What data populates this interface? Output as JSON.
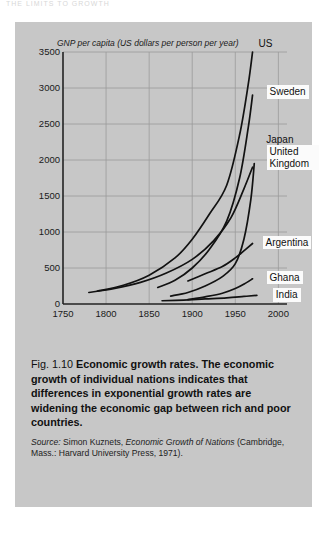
{
  "page": {
    "cut_off_header": "THE LIMITS TO GROWTH"
  },
  "figure": {
    "caption_number": "Fig. 1.10",
    "caption_lead": "Economic growth rates.",
    "caption_text": "The economic growth of individual nations indicates that differences in exponential growth rates are widening the economic gap between rich and poor countries.",
    "source_label": "Source:",
    "source_author": "Simon Kuznets,",
    "source_title": "Economic Growth of Nations",
    "source_publication": "(Cambridge, Mass.: Harvard University Press, 1971)."
  },
  "colors": {
    "panel_background": "#c7c7c7",
    "page_background": "#ffffff",
    "curve": "#121212",
    "grid": "#9a9a9a",
    "axis": "#222222",
    "label_box": "#fbfbfb"
  },
  "chart_data": {
    "type": "line",
    "title": "",
    "axis_title": "GNP per capita (US dollars per person per year)",
    "xlabel": "",
    "ylabel": "GNP per capita (US dollars per person per year)",
    "xlim": [
      1750,
      2010
    ],
    "ylim": [
      0,
      3500
    ],
    "xticks": [
      1750,
      1800,
      1850,
      1900,
      1950,
      2000
    ],
    "yticks": [
      0,
      500,
      1000,
      1500,
      2000,
      2500,
      3000,
      3500
    ],
    "grid": true,
    "legend_position": "inline-labels",
    "series": [
      {
        "name": "US",
        "label_boxed": false,
        "x": [
          1790,
          1820,
          1850,
          1880,
          1900,
          1920,
          1940,
          1955,
          1965,
          1970
        ],
        "y": [
          180,
          260,
          400,
          640,
          900,
          1250,
          1650,
          2350,
          3050,
          3500
        ]
      },
      {
        "name": "Sweden",
        "label_boxed": true,
        "x": [
          1860,
          1880,
          1900,
          1920,
          1940,
          1955,
          1965,
          1970
        ],
        "y": [
          230,
          330,
          500,
          760,
          1150,
          1750,
          2450,
          2900
        ]
      },
      {
        "name": "United Kingdom",
        "label_boxed": true,
        "x": [
          1780,
          1810,
          1840,
          1870,
          1900,
          1925,
          1945,
          1960,
          1970
        ],
        "y": [
          160,
          215,
          300,
          430,
          620,
          880,
          1200,
          1600,
          1900
        ]
      },
      {
        "name": "Japan",
        "label_boxed": false,
        "x": [
          1875,
          1895,
          1915,
          1935,
          1950,
          1960,
          1968,
          1972
        ],
        "y": [
          110,
          160,
          250,
          380,
          560,
          900,
          1450,
          1950
        ]
      },
      {
        "name": "Argentina",
        "label_boxed": true,
        "x": [
          1895,
          1915,
          1935,
          1950,
          1962,
          1970
        ],
        "y": [
          320,
          420,
          520,
          640,
          760,
          840
        ]
      },
      {
        "name": "Ghana",
        "label_boxed": true,
        "x": [
          1895,
          1915,
          1935,
          1950,
          1962,
          1970
        ],
        "y": [
          60,
          100,
          150,
          215,
          290,
          350
        ]
      },
      {
        "name": "India",
        "label_boxed": true,
        "x": [
          1865,
          1890,
          1915,
          1940,
          1960,
          1975
        ],
        "y": [
          45,
          55,
          70,
          85,
          105,
          120
        ]
      }
    ]
  }
}
